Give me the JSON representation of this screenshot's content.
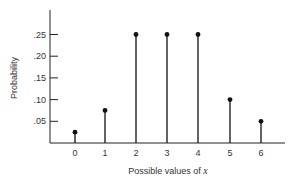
{
  "chart_data": {
    "type": "bar",
    "subtype": "stem",
    "title": "",
    "xlabel": "Possible values of x",
    "xlabel_prefix": "Possible values of ",
    "xlabel_var": "x",
    "ylabel": "Probability",
    "categories": [
      "0",
      "1",
      "2",
      "3",
      "4",
      "5",
      "6"
    ],
    "values": [
      0.025,
      0.075,
      0.25,
      0.25,
      0.25,
      0.1,
      0.05
    ],
    "yticks": [
      ".05",
      ".10",
      ".15",
      ".20",
      ".25"
    ],
    "ytick_values": [
      0.05,
      0.1,
      0.15,
      0.2,
      0.25
    ],
    "ylim": [
      0,
      0.31
    ],
    "grid": false,
    "legend": null
  }
}
